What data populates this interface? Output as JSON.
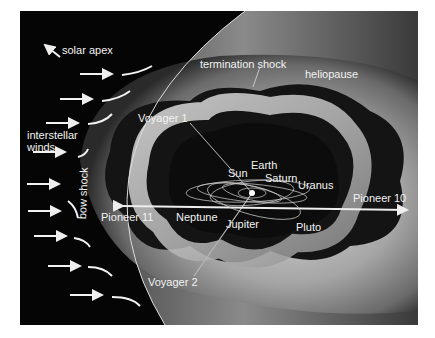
{
  "figure": {
    "labels": {
      "solar_apex": "solar apex",
      "termination_shock": "termination shock",
      "heliopause": "heliopause",
      "interstellar_winds": "interstellar winds",
      "bow_shock": "bow shock",
      "voyager_1": "Voyager 1",
      "voyager_2": "Voyager 2",
      "pioneer_10": "Pioneer 10",
      "pioneer_11": "Pioneer 11"
    },
    "planets": {
      "sun": "Sun",
      "earth": "Earth",
      "saturn": "Saturn",
      "uranus": "Uranus",
      "neptune": "Neptune",
      "jupiter": "Jupiter",
      "pluto": "Pluto"
    },
    "colors": {
      "background": "#050505",
      "label": "#f2f2f2",
      "page": "#ffffff"
    }
  }
}
